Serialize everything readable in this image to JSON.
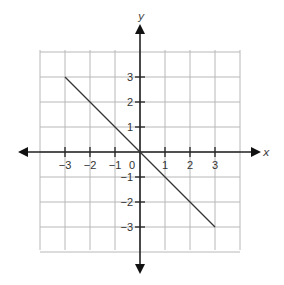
{
  "chart_data": {
    "type": "line",
    "title": "",
    "xlabel": "x",
    "ylabel": "y",
    "xlim": [
      -4,
      4
    ],
    "ylim": [
      -4,
      4
    ],
    "grid": true,
    "x_ticks": [
      -3,
      -2,
      -1,
      1,
      2,
      3
    ],
    "y_ticks": [
      3,
      2,
      1,
      -1,
      -2,
      -3
    ],
    "x_tick_labels": [
      "−3",
      "−2",
      "−1",
      "1",
      "2",
      "3"
    ],
    "y_tick_labels": [
      "3",
      "2",
      "1",
      "−1",
      "−2",
      "−3"
    ],
    "origin_label": "0",
    "series": [
      {
        "name": "line",
        "x": [
          -3,
          3
        ],
        "y": [
          3,
          -3
        ]
      }
    ],
    "legend": null
  },
  "colors": {
    "grid": "#b8b8b8",
    "axis": "#222222",
    "line": "#333333",
    "background": "#ffffff"
  }
}
